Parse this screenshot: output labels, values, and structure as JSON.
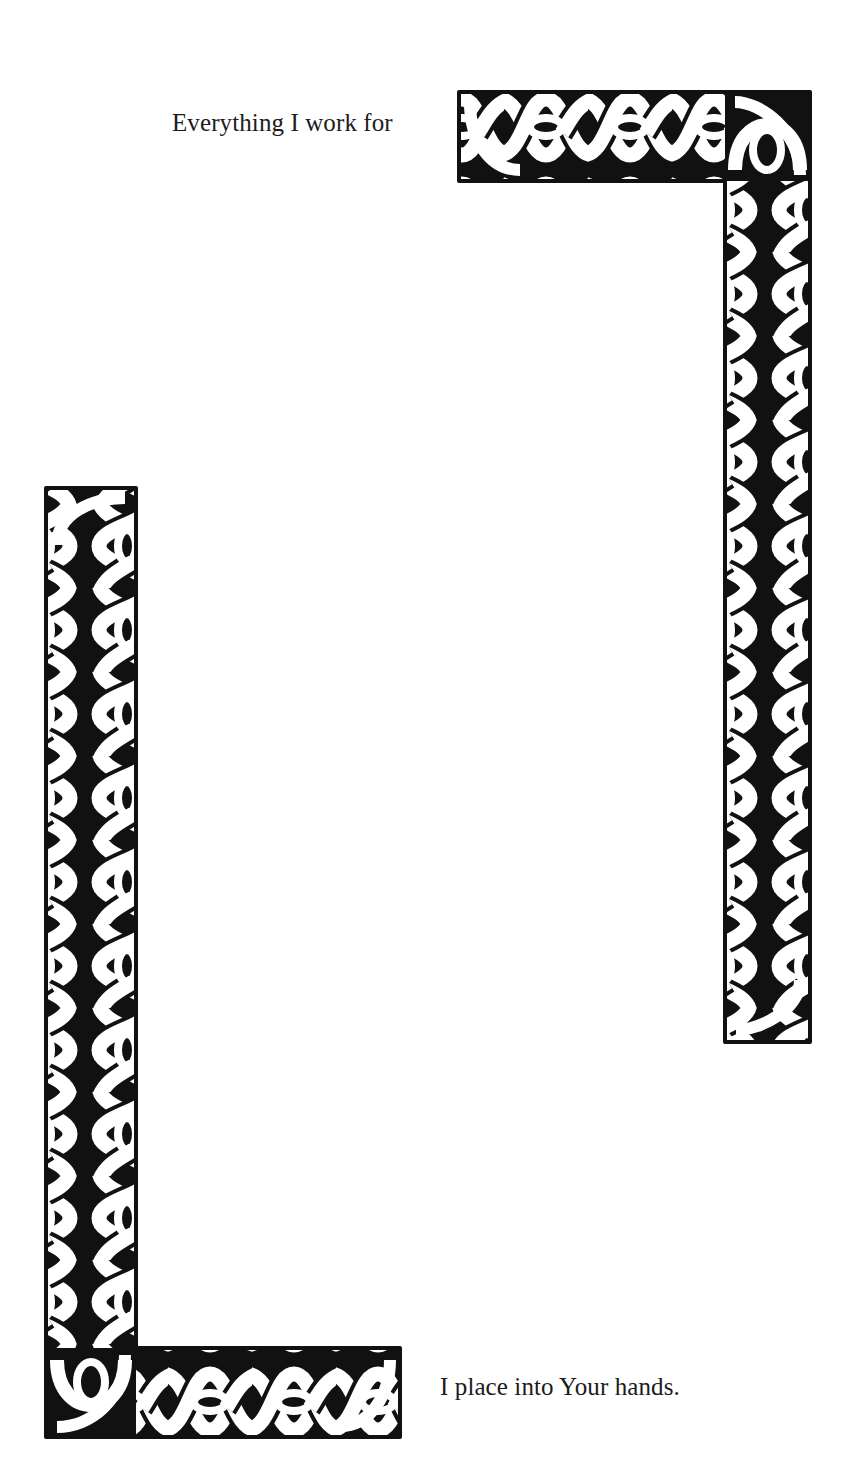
{
  "page": {
    "background": "#ffffff",
    "ink_color": "#111111"
  },
  "captions": {
    "top": "Everything I work for",
    "bottom": "I place into Your hands."
  },
  "ornaments": {
    "style": "celtic-knotwork-braid",
    "top_right": {
      "shape": "inverted-L",
      "horizontal_bar": {
        "x": 459,
        "y": 92,
        "width": 350,
        "height": 89
      },
      "vertical_bar": {
        "x": 725,
        "y": 92,
        "width": 85,
        "height": 950
      }
    },
    "bottom_left": {
      "shape": "L",
      "vertical_bar": {
        "x": 46,
        "y": 488,
        "width": 90,
        "height": 950
      },
      "horizontal_bar": {
        "x": 46,
        "y": 1348,
        "width": 354,
        "height": 89
      }
    }
  }
}
